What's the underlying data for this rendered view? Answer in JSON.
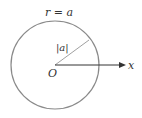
{
  "diagram": {
    "title_label": "r = a",
    "radius_label": "|a|",
    "origin_label": "O",
    "axis_label": "x",
    "colors": {
      "circle": "#8a8a8a",
      "radius_line": "#888888",
      "axis": "#333333",
      "text": "#333333"
    },
    "circle": {
      "cx": 55,
      "cy": 65,
      "r": 44
    }
  }
}
